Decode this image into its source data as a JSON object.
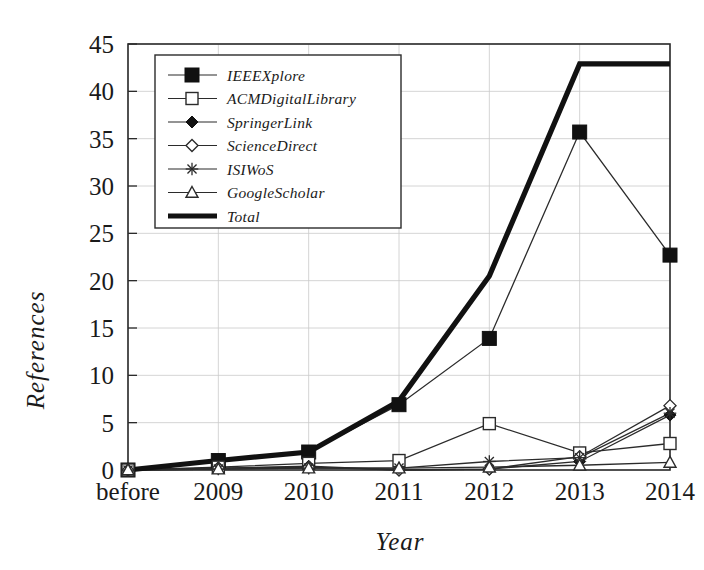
{
  "chart_data": {
    "type": "line",
    "title": "",
    "xlabel": "Year",
    "ylabel": "References",
    "categories": [
      "before",
      "2009",
      "2010",
      "2011",
      "2012",
      "2013",
      "2014"
    ],
    "ylim": [
      0,
      45
    ],
    "yticks": [
      0,
      5,
      10,
      15,
      20,
      25,
      30,
      35,
      40,
      45
    ],
    "grid": true,
    "legend_position": "upper-left-inside",
    "series": [
      {
        "name": "IEEEXplore",
        "marker": "filled-square",
        "values": [
          0,
          1.0,
          1.9,
          6.9,
          13.9,
          35.7,
          22.7
        ]
      },
      {
        "name": "ACMDigitalLibrary",
        "marker": "open-square",
        "values": [
          0,
          0.3,
          0.7,
          1.0,
          4.9,
          1.8,
          2.8
        ]
      },
      {
        "name": "SpringerLink",
        "marker": "filled-diamond",
        "values": [
          0,
          0.2,
          0.4,
          0.0,
          0.1,
          0.9,
          5.8
        ]
      },
      {
        "name": "ScienceDirect",
        "marker": "open-diamond",
        "values": [
          0,
          0.2,
          0.3,
          0.0,
          0.1,
          1.4,
          6.8
        ]
      },
      {
        "name": "ISIWoS",
        "marker": "star",
        "values": [
          0,
          0.1,
          0.2,
          0.2,
          0.9,
          1.3,
          6.0
        ]
      },
      {
        "name": "GoogleScholar",
        "marker": "open-triangle",
        "values": [
          0,
          0.1,
          0.2,
          0.2,
          0.3,
          0.5,
          0.8
        ]
      },
      {
        "name": "Total",
        "marker": "none",
        "values": [
          0,
          1.0,
          1.9,
          7.3,
          20.5,
          42.9,
          42.9
        ]
      }
    ]
  },
  "axis": {
    "y_tick_labels": [
      "0",
      "5",
      "10",
      "15",
      "20",
      "25",
      "30",
      "35",
      "40",
      "45"
    ],
    "x_tick_labels": [
      "before",
      "2009",
      "2010",
      "2011",
      "2012",
      "2013",
      "2014"
    ],
    "y_title": "References",
    "x_title": "Year"
  },
  "legend": {
    "entries": [
      {
        "label": "IEEEXplore",
        "marker": "filled-square"
      },
      {
        "label": "ACMDigitalLibrary",
        "marker": "open-square"
      },
      {
        "label": "SpringerLink",
        "marker": "filled-diamond"
      },
      {
        "label": "ScienceDirect",
        "marker": "open-diamond"
      },
      {
        "label": "ISIWoS",
        "marker": "star"
      },
      {
        "label": "GoogleScholar",
        "marker": "open-triangle"
      },
      {
        "label": "Total",
        "marker": "thick-line"
      }
    ]
  },
  "colors": {
    "ink": "#1a1a1a",
    "line": "#2b2b2b",
    "total": "#111111",
    "grid": "#c9c9c9",
    "background": "#ffffff"
  }
}
